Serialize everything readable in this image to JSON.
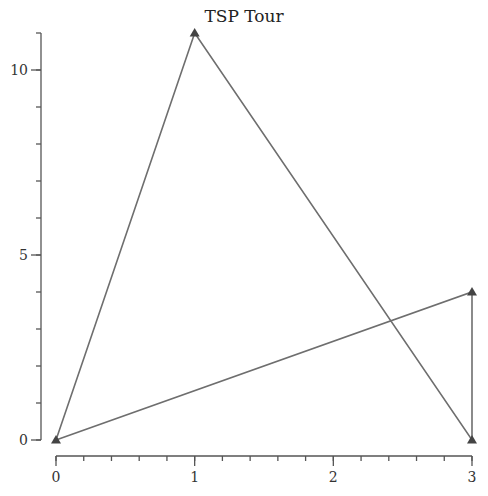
{
  "chart_data": {
    "type": "line",
    "title": "TSP Tour",
    "xlabel": "",
    "ylabel": "",
    "xlim": [
      0,
      3
    ],
    "ylim": [
      0,
      11
    ],
    "x_ticks": [
      0,
      1,
      2,
      3
    ],
    "x_tick_labels": [
      "0",
      "1",
      "2",
      "3"
    ],
    "x_minor_step": 0.2,
    "y_ticks": [
      0,
      5,
      10
    ],
    "y_tick_labels": [
      "0",
      "5",
      "10"
    ],
    "y_minor_step": 1,
    "grid": false,
    "legend": null,
    "marker": "triangle",
    "series": [
      {
        "name": "tour",
        "points": [
          {
            "x": 0,
            "y": 0
          },
          {
            "x": 1,
            "y": 11
          },
          {
            "x": 3,
            "y": 0
          },
          {
            "x": 3,
            "y": 4
          },
          {
            "x": 0,
            "y": 0
          }
        ]
      }
    ],
    "colors": {
      "line": "#6e6e6e",
      "marker": "#444444",
      "axis": "#555555"
    }
  }
}
